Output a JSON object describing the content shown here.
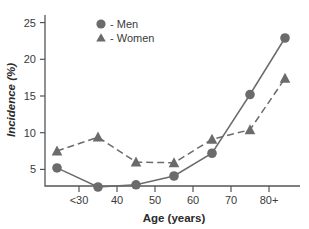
{
  "chart_data": {
    "type": "line",
    "title": "",
    "xlabel": "Age (years)",
    "ylabel": "Incidence (%)",
    "x_tick_labels": [
      "<30",
      "40",
      "50",
      "60",
      "70",
      "80+"
    ],
    "y_tick_labels": [
      "5",
      "10",
      "15",
      "20",
      "25"
    ],
    "y_ticks": [
      5,
      10,
      15,
      20,
      25
    ],
    "ylim": [
      0,
      25
    ],
    "grid": false,
    "legend_position": "top-center",
    "categories": [
      "<30",
      "35",
      "45",
      "55",
      "65",
      "75",
      "80+"
    ],
    "x": [
      25,
      35,
      45,
      55,
      65,
      75,
      85
    ],
    "series": [
      {
        "name": "Men",
        "legend_label": "- Men",
        "marker": "circle",
        "linestyle": "solid",
        "color": "#6b6b6b",
        "values": [
          5.2,
          2.6,
          2.9,
          4.1,
          7.2,
          15.2,
          22.9
        ]
      },
      {
        "name": "Women",
        "legend_label": "- Women",
        "marker": "triangle",
        "linestyle": "dashed",
        "color": "#6b6b6b",
        "values": [
          7.5,
          9.4,
          6.0,
          5.9,
          9.1,
          10.4,
          17.4
        ]
      }
    ]
  },
  "colors": {
    "series_gray": "#6b6b6b",
    "axis_gray": "#555555",
    "text_dark": "#2b2b2b",
    "background": "#ffffff"
  }
}
